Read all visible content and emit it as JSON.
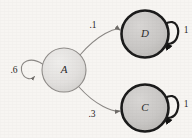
{
  "diagram": {
    "type": "markov-chain-state-diagram",
    "background_color": "#f7f5f2",
    "nodes": [
      {
        "id": "A",
        "label": "A",
        "cx": 64,
        "cy": 70,
        "r": 22,
        "fill": "#e2e0de",
        "stroke": "#8e8b88",
        "stroke_width": 1.1,
        "kind": "transient-state"
      },
      {
        "id": "D",
        "label": "D",
        "cx": 145,
        "cy": 34,
        "r": 23.5,
        "fill": "#c9c7c5",
        "stroke": "#1a1a1a",
        "stroke_width": 2.6,
        "kind": "absorbing-state"
      },
      {
        "id": "C",
        "label": "C",
        "cx": 145,
        "cy": 108,
        "r": 23.5,
        "fill": "#c9c7c5",
        "stroke": "#1a1a1a",
        "stroke_width": 2.6,
        "kind": "absorbing-state"
      }
    ],
    "edges": [
      {
        "id": "A-to-D",
        "from": "A",
        "to": "D",
        "weight": ".1",
        "label_x": 93,
        "label_y": 26,
        "stroke": "#8a8784",
        "stroke_width": 1.1
      },
      {
        "id": "A-to-C",
        "from": "A",
        "to": "C",
        "weight": ".3",
        "label_x": 92,
        "label_y": 115,
        "stroke": "#8a8784",
        "stroke_width": 1.1
      }
    ],
    "self_loops": [
      {
        "id": "A-self-loop",
        "node": "A",
        "weight": ".6",
        "label_x": 14,
        "label_y": 71,
        "side": "left",
        "stroke": "#8a8784",
        "stroke_width": 1.1
      },
      {
        "id": "D-self-loop",
        "node": "D",
        "weight": "1",
        "label_x": 186,
        "label_y": 31,
        "side": "right",
        "stroke": "#1a1a1a",
        "stroke_width": 2.2
      },
      {
        "id": "C-self-loop",
        "node": "C",
        "weight": "1",
        "label_x": 186,
        "label_y": 105,
        "side": "right",
        "stroke": "#1a1a1a",
        "stroke_width": 2.2
      }
    ]
  }
}
